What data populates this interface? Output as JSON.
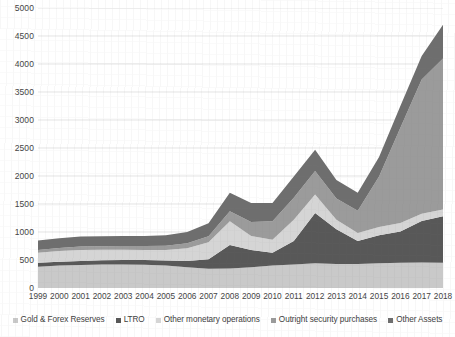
{
  "chart_data": {
    "type": "area",
    "stacked": true,
    "title": "",
    "subtitle": "",
    "xlabel": "",
    "ylabel": "",
    "xlim": [
      1999,
      2018
    ],
    "ylim": [
      0,
      5000
    ],
    "ytick_step": 500,
    "yticks": [
      0,
      500,
      1000,
      1500,
      2000,
      2500,
      3000,
      3500,
      4000,
      4500,
      5000
    ],
    "grid": "horizontal",
    "legend_position": "bottom",
    "categories": [
      "1999",
      "2000",
      "2001",
      "2002",
      "2003",
      "2004",
      "2005",
      "2006",
      "2007",
      "2008",
      "2009",
      "2010",
      "2011",
      "2012",
      "2013",
      "2014",
      "2015",
      "2016",
      "2017",
      "2018"
    ],
    "series": [
      {
        "name": "Gold & Forex Reserves",
        "color": "#c9c9c9",
        "values": [
          380,
          400,
          410,
          420,
          420,
          415,
          400,
          370,
          345,
          350,
          370,
          400,
          420,
          440,
          430,
          430,
          440,
          450,
          455,
          450
        ]
      },
      {
        "name": "LTRO",
        "color": "#585858",
        "values": [
          70,
          70,
          70,
          75,
          80,
          85,
          90,
          110,
          170,
          420,
          310,
          230,
          420,
          900,
          620,
          410,
          500,
          560,
          740,
          830
        ]
      },
      {
        "name": "Other monetary operations",
        "color": "#d5d5d5",
        "values": [
          180,
          190,
          200,
          190,
          185,
          180,
          190,
          230,
          300,
          420,
          250,
          230,
          380,
          330,
          170,
          140,
          150,
          150,
          130,
          120
        ]
      },
      {
        "name": "Outright security purchases",
        "color": "#9b9b9b",
        "values": [
          50,
          55,
          60,
          60,
          65,
          70,
          75,
          90,
          110,
          180,
          250,
          330,
          390,
          420,
          380,
          400,
          900,
          1700,
          2400,
          2700
        ]
      },
      {
        "name": "Other Assets",
        "color": "#6e6e6e",
        "values": [
          170,
          175,
          180,
          180,
          180,
          180,
          185,
          200,
          230,
          330,
          340,
          330,
          380,
          380,
          330,
          320,
          350,
          390,
          420,
          600
        ]
      }
    ],
    "stack_totals": [
      850,
      890,
      920,
      925,
      930,
      930,
      940,
      1000,
      1155,
      1700,
      1520,
      1520,
      1990,
      2470,
      1930,
      1700,
      2340,
      3250,
      4145,
      4700
    ]
  },
  "legend": {
    "items": [
      {
        "label": "Gold & Forex Reserves"
      },
      {
        "label": "LTRO"
      },
      {
        "label": "Other monetary operations"
      },
      {
        "label": "Outright security purchases"
      },
      {
        "label": "Other Assets"
      }
    ]
  }
}
